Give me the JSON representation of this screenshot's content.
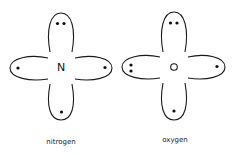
{
  "diagram": {
    "type": "orbital-electron-diagram",
    "atoms": [
      {
        "label": "nitrogen",
        "symbol": "N",
        "lobes": {
          "top": 2,
          "left": 1,
          "right": 1,
          "bottom": 1
        }
      },
      {
        "label": "oxygen",
        "symbol": "",
        "nucleus_marker": "open-circle",
        "lobes": {
          "top": 2,
          "left": 2,
          "right": 1,
          "bottom": 1
        }
      }
    ],
    "colors": {
      "line": "#1a1a1a",
      "background": "#ffffff"
    }
  }
}
